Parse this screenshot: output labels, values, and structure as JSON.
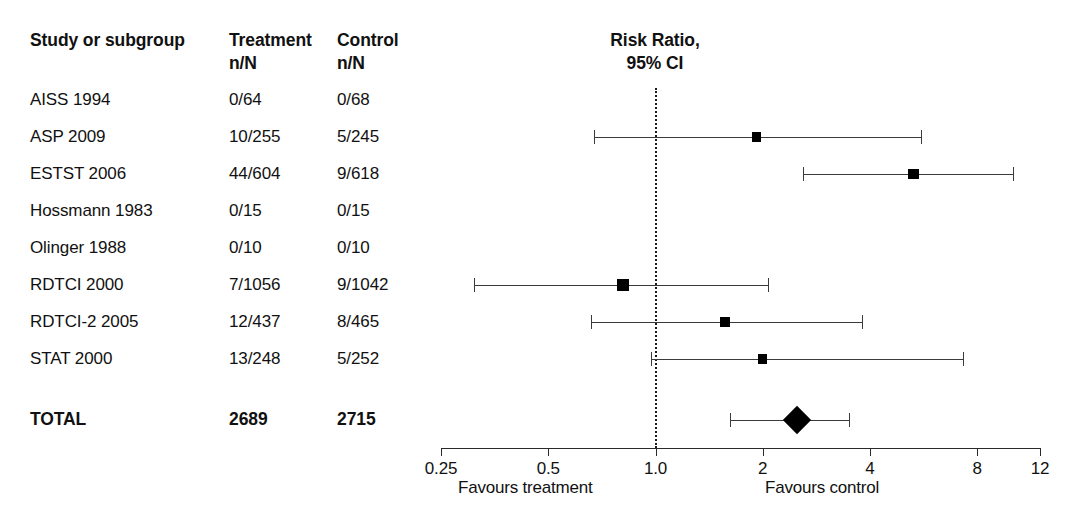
{
  "table": {
    "headers": {
      "study": "Study or subgroup",
      "treatment": "Treatment\nn/N",
      "control": "Control\nn/N"
    },
    "rows": [
      {
        "study": "AISS 1994",
        "treatment": "0/64",
        "control": "0/68"
      },
      {
        "study": "ASP 2009",
        "treatment": "10/255",
        "control": "5/245"
      },
      {
        "study": "ESTST 2006",
        "treatment": "44/604",
        "control": "9/618"
      },
      {
        "study": "Hossmann 1983",
        "treatment": "0/15",
        "control": "0/15"
      },
      {
        "study": "Olinger 1988",
        "treatment": "0/10",
        "control": "0/10"
      },
      {
        "study": "RDTCI 2000",
        "treatment": "7/1056",
        "control": "9/1042"
      },
      {
        "study": "RDTCI-2 2005",
        "treatment": "12/437",
        "control": "8/465"
      },
      {
        "study": "STAT 2000",
        "treatment": "13/248",
        "control": "5/252"
      }
    ],
    "total": {
      "study": "TOTAL",
      "treatment": "2689",
      "control": "2715"
    }
  },
  "plot": {
    "title": "Risk Ratio,\n95% CI",
    "favours_left": "Favours treatment",
    "favours_right": "Favours control",
    "null_value": "1.0"
  },
  "chart_data": {
    "type": "forest",
    "title": "Risk Ratio, 95% CI",
    "xlabel": "Risk Ratio",
    "xscale": "log",
    "xlim": [
      0.25,
      12
    ],
    "xticks": [
      "0.25",
      "0.5",
      "1.0",
      "2",
      "4",
      "8",
      "12"
    ],
    "xtick_values": [
      0.25,
      0.5,
      1.0,
      2,
      4,
      8,
      12
    ],
    "null_line": 1.0,
    "grid": false,
    "legend": "none",
    "left_annotation": "Favours treatment",
    "right_annotation": "Favours control",
    "studies": [
      {
        "label": "AISS 1994",
        "treatment_events": 0,
        "treatment_total": 64,
        "control_events": 0,
        "control_total": 68,
        "rr": null,
        "ci_low": null,
        "ci_high": null,
        "estimable": false
      },
      {
        "label": "ASP 2009",
        "treatment_events": 10,
        "treatment_total": 255,
        "control_events": 5,
        "control_total": 245,
        "rr": 1.92,
        "ci_low": 0.67,
        "ci_high": 5.55,
        "estimable": true
      },
      {
        "label": "ESTST 2006",
        "treatment_events": 44,
        "treatment_total": 604,
        "control_events": 9,
        "control_total": 618,
        "rr": 5.3,
        "ci_low": 2.6,
        "ci_high": 10.1,
        "estimable": true
      },
      {
        "label": "Hossmann 1983",
        "treatment_events": 0,
        "treatment_total": 15,
        "control_events": 0,
        "control_total": 15,
        "rr": null,
        "ci_low": null,
        "ci_high": null,
        "estimable": false
      },
      {
        "label": "Olinger 1988",
        "treatment_events": 0,
        "treatment_total": 10,
        "control_events": 0,
        "control_total": 10,
        "rr": null,
        "ci_low": null,
        "ci_high": null,
        "estimable": false
      },
      {
        "label": "RDTCI 2000",
        "treatment_events": 7,
        "treatment_total": 1056,
        "control_events": 9,
        "control_total": 1042,
        "rr": 0.81,
        "ci_low": 0.31,
        "ci_high": 2.07,
        "estimable": true
      },
      {
        "label": "RDTCI-2 2005",
        "treatment_events": 12,
        "treatment_total": 437,
        "control_events": 8,
        "control_total": 465,
        "rr": 1.57,
        "ci_low": 0.66,
        "ci_high": 3.8,
        "estimable": true
      },
      {
        "label": "STAT 2000",
        "treatment_events": 13,
        "treatment_total": 248,
        "control_events": 5,
        "control_total": 252,
        "rr": 2.0,
        "ci_low": 0.97,
        "ci_high": 7.3,
        "estimable": true
      }
    ],
    "total": {
      "label": "TOTAL",
      "treatment_total": 2689,
      "control_total": 2715,
      "rr": 2.5,
      "ci_low": 1.62,
      "ci_high": 3.5
    }
  }
}
